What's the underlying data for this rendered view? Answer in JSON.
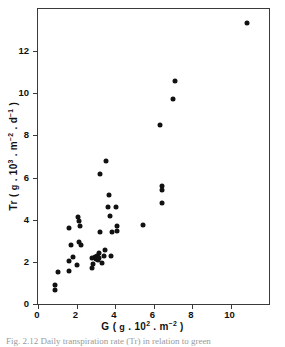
{
  "figure": {
    "caption": "Fig. 2.12  Daily transpiration rate (Tr) in relation to green"
  },
  "chart_data": {
    "type": "scatter",
    "title": "",
    "xlabel": "G ( g . 10² . m⁻² )",
    "ylabel": "Tr ( g . 10³ . m⁻² . d⁻¹ )",
    "xlabel_parts": {
      "symbol": "G",
      "open": "(",
      "unit_1": "g",
      "sep_1": ".",
      "factor_base": "10",
      "factor_exp": "2",
      "sep_2": ".",
      "unit_2": "m",
      "unit_2_exp": "-2",
      "close": ")"
    },
    "ylabel_parts": {
      "symbol": "Tr",
      "open": "(",
      "unit_1": "g",
      "sep_1": ".",
      "factor_base": "10",
      "factor_exp": "3",
      "sep_2": ".",
      "unit_2": "m",
      "unit_2_exp": "-2",
      "sep_3": ".",
      "unit_3": "d",
      "unit_3_exp": "-1",
      "close": ")"
    },
    "xlim": [
      0,
      12
    ],
    "ylim": [
      0,
      14
    ],
    "xticks": [
      0,
      2,
      4,
      6,
      8,
      10
    ],
    "yticks": [
      0,
      2,
      4,
      6,
      8,
      10,
      12
    ],
    "xticklabels": [
      "0",
      "2",
      "4",
      "6",
      "8",
      "10"
    ],
    "yticklabels": [
      "0",
      "2",
      "4",
      "6",
      "8",
      "10",
      "12"
    ],
    "grid": false,
    "legend": null,
    "marker": "filled-circle",
    "marker_color": "#111111",
    "frame_color": "#3a3a3a",
    "points": [
      [
        0.9,
        0.9
      ],
      [
        0.9,
        0.65
      ],
      [
        1.05,
        1.5
      ],
      [
        1.6,
        2.05
      ],
      [
        1.6,
        1.58
      ],
      [
        1.62,
        3.6
      ],
      [
        1.7,
        2.8
      ],
      [
        1.8,
        2.25
      ],
      [
        2.0,
        1.85
      ],
      [
        2.1,
        4.12
      ],
      [
        2.12,
        3.95
      ],
      [
        2.15,
        2.95
      ],
      [
        2.2,
        3.68
      ],
      [
        2.25,
        2.8
      ],
      [
        2.8,
        2.18
      ],
      [
        2.82,
        1.72
      ],
      [
        2.85,
        1.92
      ],
      [
        2.95,
        2.22
      ],
      [
        3.0,
        2.12
      ],
      [
        3.05,
        2.3
      ],
      [
        3.08,
        2.15
      ],
      [
        3.1,
        2.25
      ],
      [
        3.12,
        2.08
      ],
      [
        3.15,
        2.4
      ],
      [
        3.18,
        2.2
      ],
      [
        3.2,
        3.4
      ],
      [
        3.22,
        6.15
      ],
      [
        3.3,
        1.95
      ],
      [
        3.45,
        2.28
      ],
      [
        3.5,
        2.55
      ],
      [
        3.55,
        6.8
      ],
      [
        3.62,
        4.6
      ],
      [
        3.7,
        5.15
      ],
      [
        3.75,
        4.18
      ],
      [
        3.8,
        2.28
      ],
      [
        3.85,
        3.42
      ],
      [
        4.05,
        4.6
      ],
      [
        4.1,
        3.72
      ],
      [
        4.12,
        3.45
      ],
      [
        5.45,
        3.75
      ],
      [
        6.35,
        8.5
      ],
      [
        6.42,
        5.58
      ],
      [
        6.45,
        5.42
      ],
      [
        6.45,
        4.8
      ],
      [
        7.0,
        9.75
      ],
      [
        7.1,
        10.58
      ],
      [
        10.85,
        13.35
      ]
    ]
  }
}
